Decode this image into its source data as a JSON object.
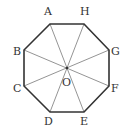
{
  "diagram": {
    "vertices": [
      {
        "name": "A",
        "x": 50,
        "y": 24,
        "lx": 44,
        "ly": 15
      },
      {
        "name": "H",
        "x": 84,
        "y": 24,
        "lx": 80,
        "ly": 15
      },
      {
        "name": "G",
        "x": 109,
        "y": 50,
        "lx": 111,
        "ly": 55
      },
      {
        "name": "F",
        "x": 109,
        "y": 86,
        "lx": 111,
        "ly": 92
      },
      {
        "name": "E",
        "x": 84,
        "y": 112,
        "lx": 80,
        "ly": 125
      },
      {
        "name": "D",
        "x": 50,
        "y": 112,
        "lx": 44,
        "ly": 125
      },
      {
        "name": "C",
        "x": 24,
        "y": 86,
        "lx": 13,
        "ly": 92
      },
      {
        "name": "B",
        "x": 24,
        "y": 50,
        "lx": 13,
        "ly": 55
      }
    ],
    "center": {
      "name": "O",
      "x": 67,
      "y": 68,
      "lx": 62,
      "ly": 86
    },
    "diagonals": [
      [
        "A",
        "E"
      ],
      [
        "H",
        "D"
      ],
      [
        "B",
        "F"
      ],
      [
        "G",
        "C"
      ]
    ],
    "colors": {
      "edge": "#333333",
      "diagonal": "#888888",
      "label": "#333333"
    }
  }
}
